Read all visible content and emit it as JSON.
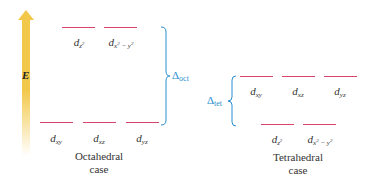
{
  "axis": {
    "energy_label": "E",
    "arrow_color": "#f2c84b"
  },
  "colors": {
    "level_line": "#d9436b",
    "delta": "#2a8fd0",
    "text": "#333333"
  },
  "octahedral": {
    "upper": [
      {
        "base": "d",
        "sub": "z",
        "sup": "2",
        "sub2": ""
      },
      {
        "base": "d",
        "sub": "x",
        "sup": "2",
        "sub2": " − y",
        "sup2": "2"
      }
    ],
    "lower": [
      {
        "base": "d",
        "sub": "xy"
      },
      {
        "base": "d",
        "sub": "xz"
      },
      {
        "base": "d",
        "sub": "yz"
      }
    ],
    "delta": {
      "symbol": "Δ",
      "sub": "oct"
    },
    "caption_line1": "Octahedral",
    "caption_line2": "case"
  },
  "tetrahedral": {
    "upper": [
      {
        "base": "d",
        "sub": "xy"
      },
      {
        "base": "d",
        "sub": "xz"
      },
      {
        "base": "d",
        "sub": "yz"
      }
    ],
    "lower": [
      {
        "base": "d",
        "sub": "z",
        "sup": "2"
      },
      {
        "base": "d",
        "sub": "x",
        "sup": "2",
        "sub2": " − y",
        "sup2": "2"
      }
    ],
    "delta": {
      "symbol": "Δ",
      "sub": "tet"
    },
    "caption_line1": "Tetrahedral",
    "caption_line2": "case"
  }
}
